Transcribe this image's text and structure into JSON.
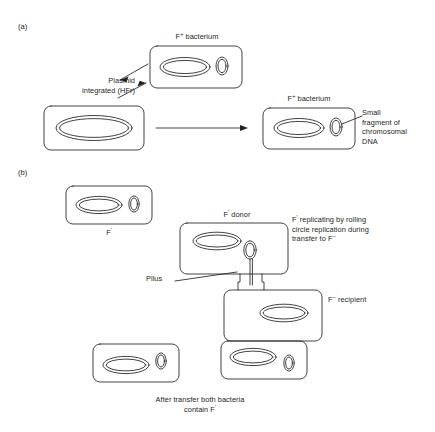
{
  "figure": {
    "background_color": "#ffffff",
    "stroke_color": "#231f20",
    "text_color": "#231f20"
  },
  "panel_a": {
    "section_label": "(a)",
    "labels": {
      "f_plus_top": "F+ bacterium",
      "plasmid_integrated": "Plasmid\nintegrated (HFr)",
      "f_plus_right": "F+ bacterium",
      "small_fragment": "Small\nfragment of\nchromosomal\nDNA"
    },
    "cells": [
      {
        "name": "f-plus-donor-cell",
        "has_chromosome": true,
        "has_plasmid": true
      },
      {
        "name": "hfr-cell",
        "has_chromosome": true,
        "has_plasmid": false
      },
      {
        "name": "f-prime-product-cell",
        "has_chromosome": true,
        "has_plasmid": true
      }
    ]
  },
  "panel_b": {
    "section_label": "(b)",
    "labels": {
      "f_prime_cell": "F'",
      "f_prime_donor": "F' donor",
      "rolling_circle": "F' replicating by rolling\ncircle replication during\ntransfer to F-",
      "pilus": "Pilus",
      "f_minus_recipient": "F- recipient",
      "after_transfer": "After transfer both bacteria\ncontain F'"
    },
    "cells": [
      {
        "name": "f-prime-cell",
        "has_chromosome": true,
        "has_plasmid": true
      },
      {
        "name": "f-prime-donor-cell",
        "has_chromosome": true,
        "has_plasmid": true
      },
      {
        "name": "f-minus-recipient-cell",
        "has_chromosome": true,
        "has_plasmid": false
      },
      {
        "name": "result-cell-left",
        "has_chromosome": true,
        "has_plasmid": true
      },
      {
        "name": "result-cell-right",
        "has_chromosome": true,
        "has_plasmid": true
      }
    ]
  }
}
